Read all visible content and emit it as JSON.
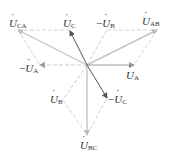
{
  "diagram": {
    "origin": [
      87,
      65
    ],
    "colors": {
      "phase": "#9a9a9a",
      "line_voltage": "#c8c8c8",
      "dashed": "#d4d4d4",
      "dark": "#555555",
      "text": "#333333"
    },
    "labels": {
      "U_CA": {
        "symbol": "U",
        "sub": "CA",
        "neg": ""
      },
      "U_C": {
        "symbol": "U",
        "sub": "C",
        "neg": ""
      },
      "neg_U_B": {
        "symbol": "U",
        "sub": "B",
        "neg": "−"
      },
      "U_AB": {
        "symbol": "U",
        "sub": "AB",
        "neg": ""
      },
      "neg_U_A": {
        "symbol": "U",
        "sub": "A",
        "neg": "−"
      },
      "U_A": {
        "symbol": "U",
        "sub": "A",
        "neg": ""
      },
      "U_B": {
        "symbol": "U",
        "sub": "B",
        "neg": ""
      },
      "neg_U_C": {
        "symbol": "U",
        "sub": "C",
        "neg": "−"
      },
      "U_BC": {
        "symbol": "U",
        "sub": "BC",
        "neg": ""
      }
    },
    "phasors": [
      {
        "name": "U_A",
        "to": [
          134,
          65
        ],
        "style": "solid-phase"
      },
      {
        "name": "neg_U_A",
        "to": [
          40,
          65
        ],
        "style": "dashed"
      },
      {
        "name": "U_C",
        "to": [
          70,
          31
        ],
        "style": "solid-dark"
      },
      {
        "name": "neg_U_C",
        "to": [
          107,
          98
        ],
        "style": "solid-dark"
      },
      {
        "name": "U_B",
        "to": [
          63,
          100
        ],
        "style": "dashed"
      },
      {
        "name": "neg_U_B",
        "to": [
          107,
          30
        ],
        "style": "dashed"
      },
      {
        "name": "U_AB",
        "to": [
          157,
          30
        ],
        "style": "solid-line"
      },
      {
        "name": "U_CA",
        "to": [
          18,
          30
        ],
        "style": "solid-line"
      },
      {
        "name": "U_BC",
        "to": [
          87,
          135
        ],
        "style": "solid-phase"
      }
    ]
  }
}
